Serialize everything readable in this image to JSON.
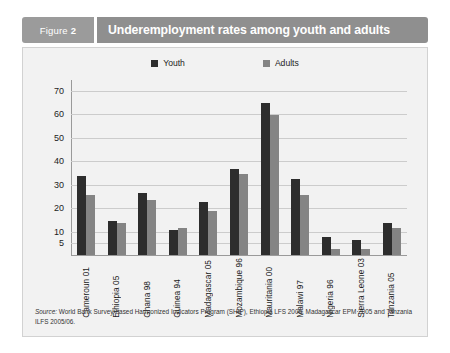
{
  "figure": {
    "tag_prefix": "Figure",
    "tag_number": "2",
    "title": "Underemployment rates among youth and adults"
  },
  "legend": {
    "items": [
      {
        "label": "Youth",
        "color": "#2d2d2d",
        "icon": "square-swatch-icon"
      },
      {
        "label": "Adults",
        "color": "#848484",
        "icon": "square-swatch-icon"
      }
    ]
  },
  "source": {
    "prefix": "Source:",
    "text": "World Bank Survey-based Harmonized Indicators Program (SHIP), Ethiopia LFS 2005, Madagascar EPM 2005 and Tanzania ILFS 2005/06."
  },
  "chart_data": {
    "type": "bar",
    "title": "Underemployment rates among youth and adults",
    "xlabel": "",
    "ylabel": "",
    "ylim": [
      0,
      75
    ],
    "grid": true,
    "legend_position": "top-center",
    "ticks": [
      "70",
      "60",
      "50",
      "40",
      "30",
      "20",
      "10",
      "5"
    ],
    "tick_values": [
      70,
      60,
      50,
      40,
      30,
      20,
      10,
      5
    ],
    "categories": [
      "Cameroun 01",
      "Ethiopia 05",
      "Ghana 98",
      "Guinea 94",
      "Madagascar 05",
      "Mozambique 96",
      "Mauritania 00",
      "Malawi 97",
      "Nigeria 96",
      "Sierra Leone 03",
      "Tanzania 05"
    ],
    "series": [
      {
        "name": "Youth",
        "color": "#2d2d2d",
        "values": [
          34,
          15,
          27,
          11,
          23,
          37,
          65,
          33,
          8,
          7,
          14
        ]
      },
      {
        "name": "Adults",
        "color": "#848484",
        "values": [
          26,
          14,
          24,
          12,
          19,
          35,
          60,
          26,
          3,
          3,
          12
        ]
      }
    ]
  }
}
